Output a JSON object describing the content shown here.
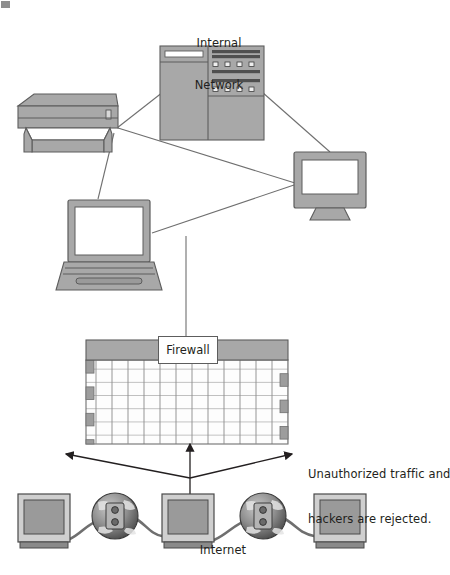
{
  "diagram": {
    "background_color": "#ffffff",
    "stroke_color": "#5d5d5d",
    "device_fill": "#a8a8a8",
    "screen_fill": "#ffffff",
    "brick_fill": "#fdfdfd",
    "brick_accent": "#9d9d9d",
    "text_color": "#231f20",
    "labels": {
      "internal_network": "Internal\nNetwork",
      "internal_network_line1": "Internal",
      "internal_network_line2": "Network",
      "firewall": "Firewall",
      "internet": "Internet",
      "rejected_line1": "Unauthorized traffic and",
      "rejected_line2": "hackers are rejected."
    },
    "nodes": [
      {
        "id": "server-tower",
        "name": "server-tower",
        "label": "Internal Network",
        "x": 160,
        "y": 46,
        "width": 104,
        "height": 94
      },
      {
        "id": "printer",
        "name": "printer",
        "label": "",
        "x": 18,
        "y": 94,
        "width": 100,
        "height": 62
      },
      {
        "id": "laptop",
        "name": "laptop",
        "label": "",
        "x": 62,
        "y": 200,
        "width": 98,
        "height": 90
      },
      {
        "id": "desktop-monitor",
        "name": "desktop-monitor",
        "label": "",
        "x": 294,
        "y": 152,
        "width": 72,
        "height": 60
      },
      {
        "id": "firewall-wall",
        "name": "firewall-wall",
        "label": "Firewall",
        "x": 86,
        "y": 338,
        "width": 202,
        "height": 106
      },
      {
        "id": "internet-monitor-left",
        "name": "internet-monitor-left",
        "label": "",
        "x": 18,
        "y": 494,
        "width": 52,
        "height": 52
      },
      {
        "id": "internet-globe-left",
        "name": "internet-globe-left",
        "label": "",
        "x": 92,
        "y": 492,
        "width": 46,
        "height": 48
      },
      {
        "id": "internet-monitor-center",
        "name": "internet-monitor-center",
        "label": "Internet",
        "x": 162,
        "y": 494,
        "width": 52,
        "height": 52
      },
      {
        "id": "internet-globe-right",
        "name": "internet-globe-right",
        "label": "",
        "x": 240,
        "y": 492,
        "width": 46,
        "height": 48
      },
      {
        "id": "internet-monitor-right",
        "name": "internet-monitor-right",
        "label": "",
        "x": 314,
        "y": 494,
        "width": 52,
        "height": 52
      }
    ],
    "connections": [
      {
        "from": "printer",
        "to": "server-tower"
      },
      {
        "from": "printer",
        "to": "desktop-monitor"
      },
      {
        "from": "printer",
        "to": "laptop"
      },
      {
        "from": "server-tower",
        "to": "desktop-monitor"
      },
      {
        "from": "laptop",
        "to": "desktop-monitor"
      },
      {
        "from": "laptop",
        "to": "firewall-wall"
      },
      {
        "from": "firewall-wall",
        "to": "internet-monitor-center"
      }
    ],
    "arrows": [
      {
        "name": "rejected-arrow-left",
        "direction": "left",
        "from_x": 190,
        "from_y": 478,
        "to_x": 65,
        "to_y": 454
      },
      {
        "name": "rejected-arrow-right",
        "direction": "right",
        "from_x": 190,
        "from_y": 478,
        "to_x": 293,
        "to_y": 454
      },
      {
        "name": "allowed-arrow-up",
        "direction": "up",
        "from_x": 190,
        "from_y": 500,
        "to_x": 190,
        "to_y": 443
      }
    ]
  }
}
